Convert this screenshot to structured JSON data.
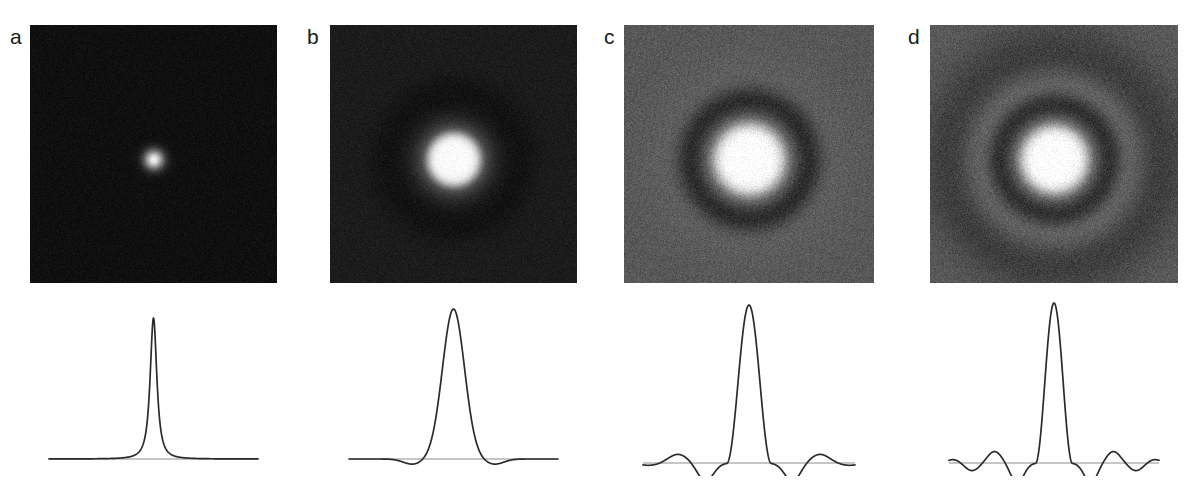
{
  "figure": {
    "type": "scientific-figure",
    "background_color": "#ffffff",
    "panel_count": 4
  },
  "panels": [
    {
      "label": "a",
      "label_x": 10,
      "label_y": 26,
      "image": {
        "x": 30,
        "y": 25,
        "width": 247,
        "height": 258,
        "background_gray": "#101010",
        "peak_gray": "#f2f2f2",
        "core_radius_px": 11,
        "halo_radius_px": 30,
        "rings": [],
        "noise_amplitude": 0.2,
        "center_x": 0.5,
        "center_y": 0.52
      },
      "profile": {
        "x": 30,
        "y": 300,
        "width": 247,
        "height": 175,
        "baseline_y": 159,
        "peak_height": 141,
        "curve_color": "#2b2b2b",
        "baseline_color": "#8d8d8d",
        "shape": "lorentzian",
        "main_lobe_halfwidth": 0.022,
        "sidelobes": []
      }
    },
    {
      "label": "b",
      "label_x": 307,
      "label_y": 26,
      "image": {
        "x": 330,
        "y": 25,
        "width": 247,
        "height": 258,
        "background_gray": "#1c1c1c",
        "peak_gray": "#fbfbfb",
        "core_radius_px": 30,
        "halo_radius_px": 58,
        "rings": [
          {
            "radius_px": 66,
            "gray": "#121212"
          }
        ],
        "noise_amplitude": 0.18,
        "center_x": 0.5,
        "center_y": 0.52
      },
      "profile": {
        "x": 330,
        "y": 300,
        "width": 247,
        "height": 175,
        "baseline_y": 159,
        "peak_height": 150,
        "curve_color": "#2b2b2b",
        "baseline_color": "#8d8d8d",
        "shape": "gaussian",
        "main_lobe_halfwidth": 0.085,
        "sidelobes": [
          {
            "center": -0.195,
            "amplitude": -0.035,
            "width": 0.075
          },
          {
            "center": 0.195,
            "amplitude": -0.035,
            "width": 0.075
          }
        ]
      }
    },
    {
      "label": "c",
      "label_x": 604,
      "label_y": 26,
      "image": {
        "x": 624,
        "y": 25,
        "width": 250,
        "height": 258,
        "background_gray": "#585858",
        "peak_gray": "#ffffff",
        "core_radius_px": 40,
        "halo_radius_px": 52,
        "rings": [
          {
            "radius_px": 64,
            "gray": "#161616"
          },
          {
            "radius_px": 88,
            "gray": "#5e5e5e"
          }
        ],
        "noise_amplitude": 0.16,
        "center_x": 0.5,
        "center_y": 0.52
      },
      "profile": {
        "x": 624,
        "y": 296,
        "width": 250,
        "height": 180,
        "baseline_y": 167,
        "peak_height": 158,
        "curve_color": "#2b2b2b",
        "baseline_color": "#8d8d8d",
        "shape": "sinc",
        "main_lobe_halfwidth": 0.105,
        "sidelobes": [
          {
            "center": -0.205,
            "amplitude": -0.115,
            "width": 0.062
          },
          {
            "center": 0.205,
            "amplitude": -0.115,
            "width": 0.062
          },
          {
            "center": -0.335,
            "amplitude": 0.055,
            "width": 0.075
          },
          {
            "center": 0.335,
            "amplitude": 0.055,
            "width": 0.075
          },
          {
            "center": -0.47,
            "amplitude": -0.015,
            "width": 0.08
          },
          {
            "center": 0.47,
            "amplitude": -0.015,
            "width": 0.08
          }
        ]
      }
    },
    {
      "label": "d",
      "label_x": 908,
      "label_y": 26,
      "image": {
        "x": 930,
        "y": 25,
        "width": 248,
        "height": 258,
        "background_gray": "#5a5a5a",
        "peak_gray": "#ffffff",
        "core_radius_px": 38,
        "halo_radius_px": 48,
        "rings": [
          {
            "radius_px": 60,
            "gray": "#151515"
          },
          {
            "radius_px": 84,
            "gray": "#7a7a7a"
          },
          {
            "radius_px": 108,
            "gray": "#3c3c3c"
          }
        ],
        "noise_amplitude": 0.16,
        "center_x": 0.5,
        "center_y": 0.52
      },
      "profile": {
        "x": 930,
        "y": 296,
        "width": 248,
        "height": 180,
        "baseline_y": 167,
        "peak_height": 160,
        "curve_color": "#2b2b2b",
        "baseline_color": "#8d8d8d",
        "shape": "sinc",
        "main_lobe_halfwidth": 0.088,
        "sidelobes": [
          {
            "center": -0.175,
            "amplitude": -0.125,
            "width": 0.052
          },
          {
            "center": 0.175,
            "amplitude": -0.125,
            "width": 0.052
          },
          {
            "center": -0.283,
            "amplitude": 0.072,
            "width": 0.055
          },
          {
            "center": 0.283,
            "amplitude": 0.072,
            "width": 0.055
          },
          {
            "center": -0.39,
            "amplitude": -0.048,
            "width": 0.055
          },
          {
            "center": 0.39,
            "amplitude": -0.048,
            "width": 0.055
          },
          {
            "center": -0.478,
            "amplitude": 0.022,
            "width": 0.05
          },
          {
            "center": 0.478,
            "amplitude": 0.022,
            "width": 0.05
          }
        ]
      }
    }
  ],
  "chart_data": {
    "type": "line",
    "title": "",
    "xlabel": "",
    "ylabel": "",
    "grid": false,
    "legend": "none",
    "series": [
      {
        "name": "a",
        "shape": "lorentzian",
        "peak_value": 1.0,
        "fwhm_fraction_of_width": 0.044,
        "sidelobe_minima": [],
        "baseline": 0
      },
      {
        "name": "b",
        "shape": "gaussian",
        "peak_value": 1.0,
        "fwhm_fraction_of_width": 0.17,
        "sidelobe_minima": [
          -0.035,
          -0.035
        ],
        "baseline": 0
      },
      {
        "name": "c",
        "shape": "sinc",
        "peak_value": 1.0,
        "fwhm_fraction_of_width": 0.21,
        "sidelobe_minima": [
          -0.115,
          -0.115
        ],
        "sidelobe_maxima": [
          0.055,
          0.055
        ],
        "baseline": 0
      },
      {
        "name": "d",
        "shape": "sinc",
        "peak_value": 1.0,
        "fwhm_fraction_of_width": 0.176,
        "sidelobe_minima": [
          -0.125,
          -0.125,
          -0.048,
          -0.048
        ],
        "sidelobe_maxima": [
          0.072,
          0.072,
          0.022,
          0.022
        ],
        "baseline": 0
      }
    ]
  }
}
